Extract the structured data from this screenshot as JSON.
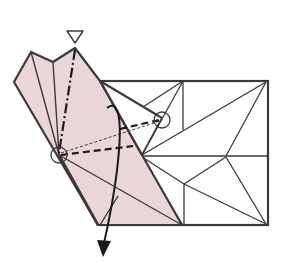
{
  "diagram": {
    "type": "origami-fold-diagram",
    "colors": {
      "paper_color_side": "#ead6d8",
      "paper_white_side": "#ffffff",
      "line": "#3a3a3a",
      "fold_line": "#1a1a1a"
    },
    "symbols": {
      "view_marker": "open-triangle (look here)",
      "mountain_fold": "dash-dot line",
      "valley_fold": "dashed line",
      "reference_points": [
        "circle-left",
        "circle-right"
      ],
      "fold_arrow": "curved arrow pointing down"
    }
  }
}
